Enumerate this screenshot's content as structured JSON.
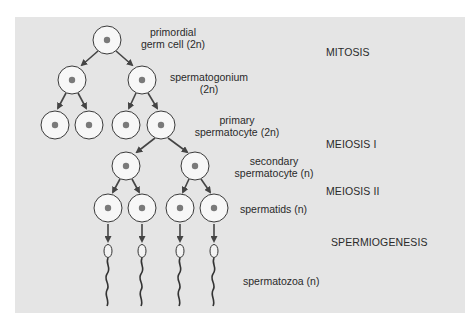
{
  "diagram": {
    "colors": {
      "background": "#e5e5e5",
      "cell_fill": "#f7f7f7",
      "cell_stroke": "#3a3a3a",
      "nucleus": "#7a7a7a",
      "arrow": "#444444",
      "text": "#2a2a2a"
    },
    "cell_labels": {
      "primordial": {
        "line1": "primordial",
        "line2": "germ cell (2n)"
      },
      "spermatogonium": {
        "line1": "spermatogonium",
        "line2": "(2n)"
      },
      "primary": {
        "line1": "primary",
        "line2": "spermatocyte (2n)"
      },
      "secondary": {
        "line1": "secondary",
        "line2": "spermatocyte (n)"
      },
      "spermatids": {
        "line1": "spermatids (n)"
      },
      "spermatozoa": {
        "line1": "spermatozoa (n)"
      }
    },
    "stages": {
      "mitosis": "MITOSIS",
      "meiosis1": "MEIOSIS I",
      "meiosis2": "MEIOSIS II",
      "spermiogenesis": "SPERMIOGENESIS"
    },
    "cells": [
      {
        "x": 107,
        "y": 40
      },
      {
        "x": 72,
        "y": 80
      },
      {
        "x": 142,
        "y": 80
      },
      {
        "x": 55,
        "y": 125
      },
      {
        "x": 89,
        "y": 125
      },
      {
        "x": 126,
        "y": 125
      },
      {
        "x": 161,
        "y": 125
      },
      {
        "x": 126,
        "y": 166
      },
      {
        "x": 195,
        "y": 166
      },
      {
        "x": 108,
        "y": 208
      },
      {
        "x": 142,
        "y": 208
      },
      {
        "x": 180,
        "y": 208
      },
      {
        "x": 214,
        "y": 208
      }
    ]
  }
}
